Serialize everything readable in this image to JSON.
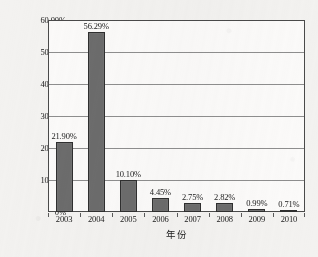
{
  "chart_data": {
    "type": "bar",
    "title": "",
    "subtitle": "",
    "xlabel": "年份",
    "ylabel": "",
    "categories": [
      "2003",
      "2004",
      "2005",
      "2006",
      "2007",
      "2008",
      "2009",
      "2010"
    ],
    "values": [
      21.9,
      56.29,
      10.1,
      4.45,
      2.75,
      2.82,
      0.99,
      0.71
    ],
    "value_labels": [
      "21.90%",
      "56.29%",
      "10.10%",
      "4.45%",
      "2.75%",
      "2.82%",
      "0.99%",
      "0.71%"
    ],
    "ylim": [
      0,
      60
    ],
    "ytick_values": [
      60,
      50,
      40,
      30,
      20,
      10,
      0
    ],
    "ytick_labels": [
      "60.00%",
      "50.00%",
      "40.00%",
      "30.00%",
      "20.00%",
      "10.00%",
      "0%"
    ],
    "grid": true,
    "legend": null,
    "legend_position": "none",
    "series": [
      {
        "name": "",
        "values": [
          21.9,
          56.29,
          10.1,
          4.45,
          2.75,
          2.82,
          0.99,
          0.71
        ]
      }
    ],
    "colors": {
      "bar_fill": "#6c6c6c",
      "bar_outline": "#2f2f2f",
      "plot_background": "#fbfaf9",
      "page_background": "#f3f2f0",
      "gridline": "#8e8e8e",
      "axis": "#4a4a4a",
      "text": "#1b1b1b"
    }
  }
}
